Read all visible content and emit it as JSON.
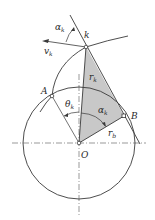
{
  "diagram": {
    "colors": {
      "stroke": "#3a3a3a",
      "fill_triangle": "#c8c8c8",
      "background": "#ffffff"
    },
    "points": {
      "O": {
        "label": "O",
        "x": 79,
        "y": 143
      },
      "k": {
        "label": "k",
        "x": 86,
        "y": 47
      },
      "A": {
        "label": "A",
        "x": 52,
        "y": 96
      },
      "B": {
        "label": "B",
        "x": 124,
        "y": 116
      }
    },
    "labels": {
      "alpha_k_top": {
        "main": "α",
        "sub": "k"
      },
      "v_k": {
        "main": "v",
        "sub": "k"
      },
      "k": "k",
      "r_k": {
        "main": "r",
        "sub": "k"
      },
      "A": "A",
      "theta_k": {
        "main": "θ",
        "sub": "k"
      },
      "alpha_k_center": {
        "main": "α",
        "sub": "k"
      },
      "B": "B",
      "r_b": {
        "main": "r",
        "sub": "b"
      },
      "O": "O"
    },
    "base_circle": {
      "cx": 79,
      "cy": 143,
      "r": 56
    }
  }
}
